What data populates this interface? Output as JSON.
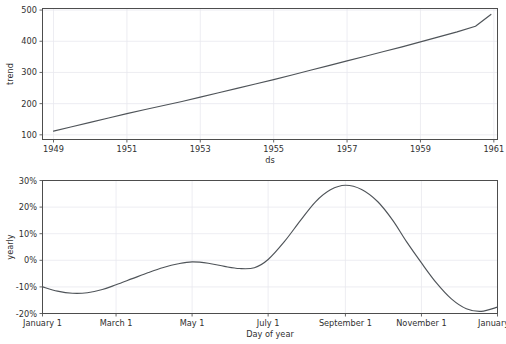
{
  "figure": {
    "background_color": "#ffffff",
    "line_color": "#4f5459",
    "grid_color": "#e8e8ef",
    "axis_color": "#4d4d4d",
    "text_color": "#303030"
  },
  "chart_data": [
    {
      "type": "line",
      "name": "trend",
      "title": "",
      "xlabel": "ds",
      "ylabel": "trend",
      "grid": true,
      "legend": false,
      "xlim": [
        1948.7,
        1961.1
      ],
      "ylim": [
        85,
        505
      ],
      "xticks": [
        1949,
        1951,
        1953,
        1955,
        1957,
        1959,
        1961
      ],
      "xticklabels": [
        "1949",
        "1951",
        "1953",
        "1955",
        "1957",
        "1959",
        "1961"
      ],
      "yticks": [
        100,
        200,
        300,
        400,
        500
      ],
      "yticklabels": [
        "100",
        "200",
        "300",
        "400",
        "500"
      ],
      "x": [
        1949.0,
        1949.5,
        1950.0,
        1950.5,
        1951.0,
        1951.5,
        1952.0,
        1952.5,
        1953.0,
        1953.5,
        1954.0,
        1954.5,
        1955.0,
        1955.5,
        1956.0,
        1956.5,
        1957.0,
        1957.5,
        1958.0,
        1958.5,
        1959.0,
        1959.5,
        1960.0,
        1960.5,
        1960.92
      ],
      "values": [
        112,
        126,
        140,
        154,
        168,
        181,
        194,
        207,
        221,
        235,
        249,
        263,
        277,
        292,
        307,
        322,
        337,
        352,
        367,
        382,
        398,
        414,
        430,
        448,
        486
      ]
    },
    {
      "type": "line",
      "name": "yearly",
      "title": "",
      "xlabel": "Day of year",
      "ylabel": "yearly",
      "grid": true,
      "legend": false,
      "xlim": [
        0,
        365
      ],
      "ylim": [
        -20,
        30
      ],
      "xticks": [
        0,
        59,
        120,
        181,
        243,
        304,
        365
      ],
      "xticklabels": [
        "January 1",
        "March 1",
        "May 1",
        "July 1",
        "September 1",
        "November 1",
        "January 1"
      ],
      "yticks": [
        -20,
        -10,
        0,
        10,
        20,
        30
      ],
      "yticklabels": [
        "-20%",
        "-10%",
        "0%",
        "10%",
        "20%",
        "30%"
      ],
      "x": [
        0,
        12,
        24,
        36,
        48,
        59,
        72,
        85,
        97,
        109,
        120,
        133,
        146,
        158,
        170,
        181,
        194,
        207,
        219,
        231,
        243,
        256,
        269,
        281,
        292,
        304,
        316,
        328,
        340,
        352,
        365
      ],
      "values": [
        -10.0,
        -11.6,
        -12.4,
        -12.2,
        -11.0,
        -9.2,
        -6.9,
        -4.6,
        -2.7,
        -1.3,
        -0.6,
        -1.1,
        -2.3,
        -3.1,
        -2.8,
        0.3,
        7.0,
        15.0,
        22.0,
        26.5,
        28.2,
        26.6,
        22.0,
        15.0,
        7.0,
        -1.0,
        -8.5,
        -14.5,
        -18.2,
        -19.2,
        -17.6
      ],
      "annotations": {
        "peak_value_percent": 28.2,
        "peak_label": "July 1",
        "trough_value_percent": -19.2,
        "trough_label": "November 1",
        "start_value_percent": -10.0,
        "end_value_percent": -10.0
      }
    }
  ]
}
